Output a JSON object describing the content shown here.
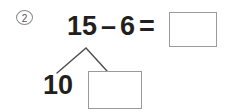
{
  "worksheet": {
    "problem_number": "2",
    "equation": {
      "minuend": "15",
      "operator": "–",
      "subtrahend": "6",
      "equals": "=",
      "answer_value": ""
    },
    "number_bond": {
      "left_part": "10",
      "right_part_value": ""
    },
    "colors": {
      "text": "#231f20",
      "box_border": "#9b9b9b",
      "marker_border": "#8a8a8a",
      "bond_line": "#4d4d4d",
      "background": "#ffffff"
    }
  }
}
